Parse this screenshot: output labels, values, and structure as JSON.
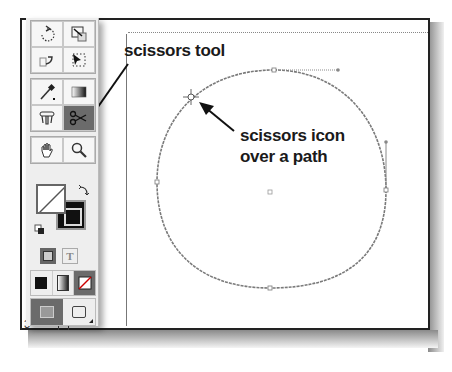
{
  "annotations": {
    "scissors_tool_label": "scissors tool",
    "scissors_icon_label_line1": "scissors icon",
    "scissors_icon_label_line2": "over a path"
  },
  "ruler": {
    "marks": [
      "1",
      "2",
      "3"
    ]
  },
  "toolbox": {
    "groups": [
      {
        "tools": [
          {
            "icon": "rotate-icon"
          },
          {
            "icon": "scale-icon"
          }
        ]
      },
      {
        "tools": [
          {
            "icon": "reflect-icon"
          },
          {
            "icon": "free-transform-icon"
          }
        ]
      },
      {
        "tools": [
          {
            "icon": "eyedropper-icon"
          },
          {
            "icon": "gradient-icon"
          }
        ]
      },
      {
        "tools": [
          {
            "icon": "blend-icon"
          },
          {
            "icon": "scissors-icon",
            "active": true
          }
        ]
      },
      {
        "tools": [
          {
            "icon": "hand-icon"
          },
          {
            "icon": "zoom-icon"
          }
        ]
      }
    ],
    "fill_stroke": {
      "fill": "none",
      "stroke": "#000000"
    },
    "mode_buttons": [
      "color",
      "gradient",
      "none"
    ],
    "view_buttons": [
      "normal-view",
      "screen-mode"
    ]
  },
  "colors": {
    "path_stroke": "#7a7a7a",
    "active_tool_bg": "#6b6b6b",
    "frame_border": "#222222"
  }
}
